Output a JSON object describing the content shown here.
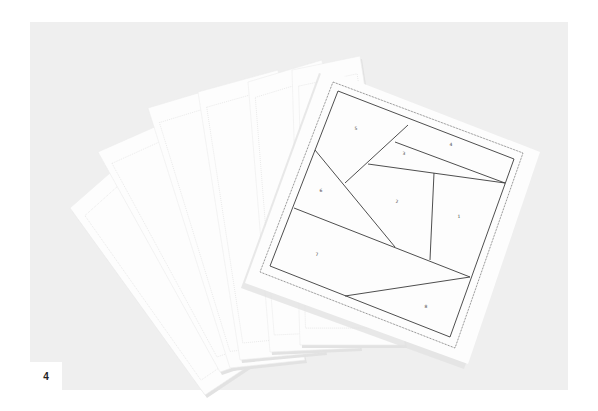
{
  "figure": {
    "number_label": "4",
    "caption": ""
  },
  "colors": {
    "page_background": "#ffffff",
    "photo_background": "#efefef",
    "paper": "#fdfdfd",
    "paper_shadow": "#e2e2e2",
    "faint_pattern": "#dcdcdc",
    "pattern_line": "#3a3a3a",
    "number_text": "#444444"
  },
  "photo_area": {
    "x": 30,
    "y": 22,
    "width": 538,
    "height": 368
  },
  "back_sheets": [
    {
      "points": "70,208 150,138 280,345 205,395"
    },
    {
      "points": "98,152 175,118 300,345 220,372"
    },
    {
      "points": "148,108 235,82 305,360 230,368"
    },
    {
      "points": "198,92 278,70 325,352 240,360"
    },
    {
      "points": "248,82 322,60 360,348 270,352"
    },
    {
      "points": "292,70 360,56 405,345 300,345"
    }
  ],
  "top_sheet": {
    "paper": "323,68 540,152 468,364 245,283",
    "outer_dotted_border": "333,82 523,153 455,348 260,272",
    "inner_border": "338,91 514,159 450,337 270,266",
    "piece_lines": [
      {
        "id": "line-5-4",
        "x1": 408,
        "y1": 125,
        "x2": 345,
        "y2": 183
      },
      {
        "id": "line-3-4",
        "x1": 395,
        "y1": 142,
        "x2": 505,
        "y2": 183
      },
      {
        "id": "line-2-3",
        "x1": 368,
        "y1": 164,
        "x2": 505,
        "y2": 183
      },
      {
        "id": "line-1-2",
        "x1": 434,
        "y1": 173,
        "x2": 430,
        "y2": 260
      },
      {
        "id": "line-6-2",
        "x1": 315,
        "y1": 150,
        "x2": 395,
        "y2": 247
      },
      {
        "id": "line-7-top",
        "x1": 294,
        "y1": 208,
        "x2": 470,
        "y2": 277
      },
      {
        "id": "line-8-top",
        "x1": 345,
        "y1": 296,
        "x2": 470,
        "y2": 277
      }
    ],
    "piece_numbers": [
      {
        "label": "1",
        "x": 459,
        "y": 218
      },
      {
        "label": "2",
        "x": 397,
        "y": 203
      },
      {
        "label": "3",
        "x": 404,
        "y": 155
      },
      {
        "label": "4",
        "x": 451,
        "y": 146
      },
      {
        "label": "5",
        "x": 356,
        "y": 130
      },
      {
        "label": "6",
        "x": 321,
        "y": 192
      },
      {
        "label": "7",
        "x": 317,
        "y": 256
      },
      {
        "label": "8",
        "x": 426,
        "y": 308
      }
    ]
  }
}
